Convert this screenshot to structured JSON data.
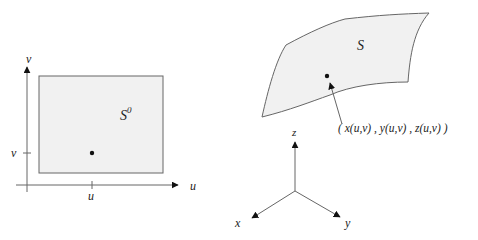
{
  "left_diagram": {
    "axis_u_label": "u",
    "axis_v_label": "v",
    "tick_u_label": "u",
    "tick_v_label": "v",
    "region_label": "S",
    "region_superscript": "0"
  },
  "right_diagram": {
    "surface_label": "S",
    "point_label": "( x(u,v) , y(u,v) , z(u,v) )",
    "axis_x_label": "x",
    "axis_y_label": "y",
    "axis_z_label": "z"
  },
  "colors": {
    "fill": "#f1f1f1",
    "stroke": "#666666",
    "text": "#222222"
  }
}
